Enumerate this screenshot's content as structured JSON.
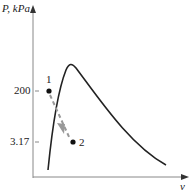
{
  "diagram": {
    "type": "P-v diagram",
    "y_axis_label": "P, kPa",
    "x_axis_label": "v",
    "y_ticks": [
      {
        "label": "200",
        "y": 91
      },
      {
        "label": "3.17",
        "y": 142
      }
    ],
    "points": [
      {
        "label": "1",
        "x": 49,
        "y": 91
      },
      {
        "label": "2",
        "x": 73,
        "y": 142
      }
    ],
    "process_line": {
      "from": "1",
      "to": "2",
      "style": "dashed-arrow",
      "color": "#999999"
    },
    "saturation_dome_color": "#222222"
  }
}
